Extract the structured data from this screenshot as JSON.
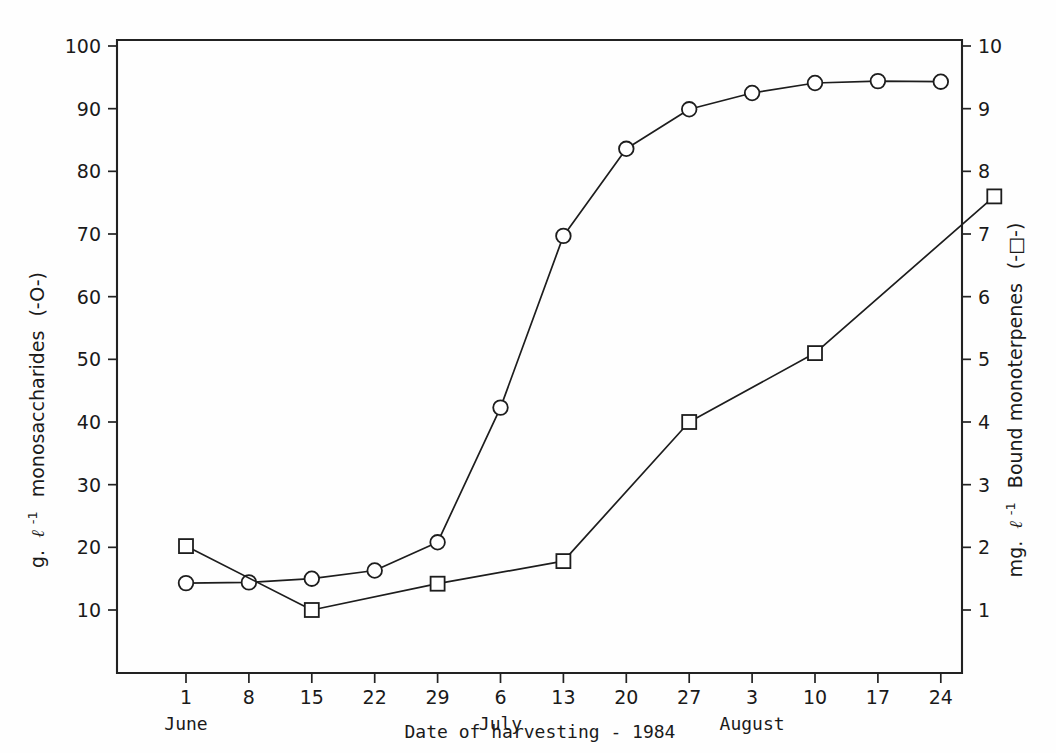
{
  "chart_data": {
    "type": "line",
    "title": "",
    "xlabel": "Date of harvesting - 1984",
    "x_tick_labels": [
      "1",
      "8",
      "15",
      "22",
      "29",
      "6",
      "13",
      "20",
      "27",
      "3",
      "10",
      "17",
      "24"
    ],
    "x_month_labels": [
      {
        "text": "June",
        "tick_index": 0
      },
      {
        "text": "July",
        "tick_index": 5
      },
      {
        "text": "August",
        "tick_index": 9
      }
    ],
    "grid": false,
    "legend_position": "axis-labels",
    "left_axis": {
      "label_parts": {
        "prefix": "g.",
        "unit_symbol": "ℓ",
        "exponent": "-1",
        "name": "monosaccharides",
        "legend": "(-O-)"
      },
      "label_full": "g. ℓ-1 monosaccharides (-O-)",
      "ylim": [
        0,
        102
      ],
      "ticks": [
        10,
        20,
        30,
        40,
        50,
        60,
        70,
        80,
        90,
        100
      ],
      "tick_labels": [
        "10",
        "20",
        "30",
        "40",
        "50",
        "60",
        "70",
        "80",
        "90",
        "100"
      ]
    },
    "right_axis": {
      "label_parts": {
        "prefix": "mg.",
        "unit_symbol": "ℓ",
        "exponent": "-1",
        "name": "Bound monoterpenes",
        "legend": "(-□-)"
      },
      "label_full": "mg. ℓ-1 Bound monoterpenes (-□-)",
      "ylim": [
        0,
        10.2
      ],
      "ticks": [
        1,
        2,
        3,
        4,
        5,
        6,
        7,
        8,
        9,
        10
      ],
      "tick_labels": [
        "1",
        "2",
        "3",
        "4",
        "5",
        "6",
        "7",
        "8",
        "9",
        "10"
      ]
    },
    "series": [
      {
        "name": "monosaccharides",
        "marker": "circle",
        "axis": "left",
        "x_ticks": [
          0,
          1,
          2,
          3,
          4,
          5,
          6,
          7,
          8,
          9,
          10,
          11,
          12
        ],
        "values": [
          14.3,
          14.4,
          15.0,
          16.3,
          20.8,
          42.3,
          69.7,
          83.6,
          89.9,
          92.5,
          94.1,
          94.4,
          94.3
        ]
      },
      {
        "name": "bound-monoterpenes",
        "marker": "square",
        "axis": "right",
        "x_ticks": [
          0,
          2,
          4,
          6,
          8,
          10,
          12.85
        ],
        "values": [
          2.02,
          1.0,
          1.42,
          1.78,
          4.0,
          5.1,
          7.6
        ]
      }
    ]
  }
}
